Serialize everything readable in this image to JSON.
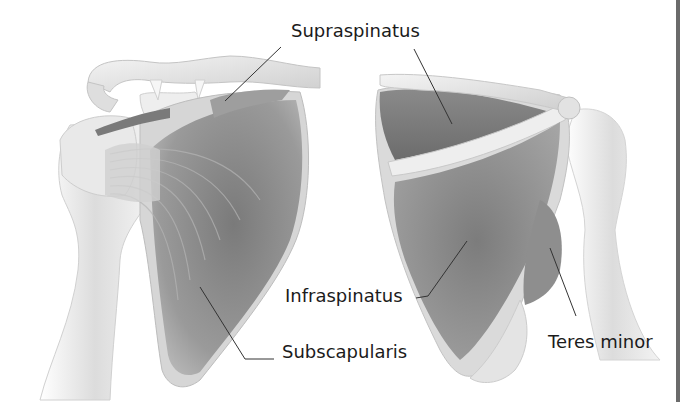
{
  "figure": {
    "views": [
      {
        "id": "anterior",
        "description": "Anterior view of right shoulder: clavicle, coracoid, scapula with subscapularis"
      },
      {
        "id": "posterior",
        "description": "Posterior view of right shoulder: scapular spine, acromion, supraspinatus, infraspinatus, teres minor"
      }
    ],
    "labels": [
      {
        "id": "supraspinatus",
        "text": "Supraspinatus",
        "x": 291,
        "y": 22
      },
      {
        "id": "infraspinatus",
        "text": "Infraspinatus",
        "x": 285,
        "y": 287
      },
      {
        "id": "subscapularis",
        "text": "Subscapularis",
        "x": 282,
        "y": 343
      },
      {
        "id": "teres_minor",
        "text": "Teres minor",
        "x": 548,
        "y": 333
      }
    ],
    "leader_lines": [
      {
        "to": "supraspinatus-anterior",
        "points": [
          [
            281,
            47
          ],
          [
            225,
            101
          ]
        ]
      },
      {
        "to": "supraspinatus-posterior",
        "points": [
          [
            414,
            49
          ],
          [
            452,
            124
          ]
        ]
      },
      {
        "to": "infraspinatus",
        "points": [
          [
            416,
            298
          ],
          [
            428,
            296
          ],
          [
            467,
            241
          ]
        ]
      },
      {
        "to": "subscapularis",
        "points": [
          [
            274,
            359
          ],
          [
            245,
            359
          ],
          [
            200,
            287
          ]
        ]
      },
      {
        "to": "teres_minor",
        "points": [
          [
            576,
            316
          ],
          [
            550,
            248
          ]
        ]
      }
    ],
    "colors": {
      "background": "#ffffff",
      "bone": "#e6e6e6",
      "bone_shadow": "#c8c8c8",
      "muscle_dark": "#6e6e6e",
      "muscle_mid": "#8c8c8c",
      "text": "#1b1b1b",
      "leader": "#333333",
      "edge_bar": "#6b6b6b"
    }
  }
}
